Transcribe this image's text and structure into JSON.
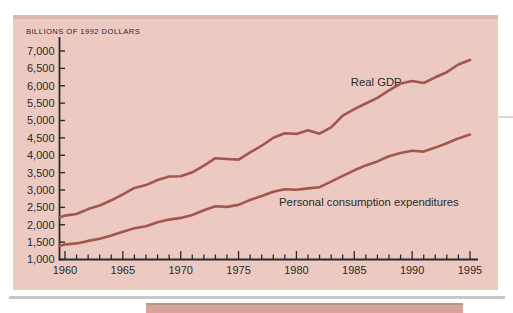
{
  "colors": {
    "page_bg": "#ffffff",
    "panel_bg": "#ecc9c1",
    "panel_top_shade": "#50403c1f",
    "line": "#a2574e",
    "axis": "#2b2b2b",
    "text": "#2b2b2b",
    "shadow_rule": "#c7c7c7",
    "caption_bar": "#d8a49a",
    "caption_bar_edge": "#b5968e",
    "artifact_line": "#dadada"
  },
  "chart_data": {
    "type": "line",
    "title": "",
    "ylabel": "BILLIONS OF 1992 DOLLARS",
    "xlabel": "",
    "xlim": [
      1959,
      1995
    ],
    "ylim": [
      1000,
      7000
    ],
    "grid": false,
    "legend_position": "inline-labels",
    "y_ticks": [
      1000,
      1500,
      2000,
      2500,
      3000,
      3500,
      4000,
      4500,
      5000,
      5500,
      6000,
      6500,
      7000
    ],
    "y_tick_labels": [
      "1,000",
      "1,500",
      "2,000",
      "2,500",
      "3,000",
      "3,500",
      "4,000",
      "4,500",
      "5,000",
      "5,500",
      "6,000",
      "6,500",
      "7,000"
    ],
    "x_tick_labels": [
      "1960",
      "1965",
      "1970",
      "1975",
      "1980",
      "1985",
      "1990",
      "1995"
    ],
    "x_minor_tick_every_years": 1,
    "years": [
      1959,
      1960,
      1961,
      1962,
      1963,
      1964,
      1965,
      1966,
      1967,
      1968,
      1969,
      1970,
      1971,
      1972,
      1973,
      1974,
      1975,
      1976,
      1977,
      1978,
      1979,
      1980,
      1981,
      1982,
      1983,
      1984,
      1985,
      1986,
      1987,
      1988,
      1989,
      1990,
      1991,
      1992,
      1993,
      1994,
      1995
    ],
    "series": [
      {
        "name": "Real GDP",
        "values": [
          2212,
          2262,
          2310,
          2449,
          2554,
          2703,
          2875,
          3060,
          3140,
          3289,
          3388,
          3398,
          3510,
          3702,
          3916,
          3891,
          3874,
          4083,
          4274,
          4503,
          4631,
          4615,
          4721,
          4620,
          4804,
          5140,
          5324,
          5488,
          5650,
          5865,
          6062,
          6136,
          6079,
          6244,
          6390,
          6611,
          6742
        ]
      },
      {
        "name": "Personal consumption expenditures",
        "values": [
          1395,
          1433,
          1462,
          1534,
          1597,
          1692,
          1799,
          1902,
          1959,
          2070,
          2148,
          2198,
          2280,
          2416,
          2533,
          2515,
          2570,
          2714,
          2830,
          2952,
          3020,
          3010,
          3046,
          3082,
          3241,
          3408,
          3567,
          3709,
          3822,
          3973,
          4065,
          4132,
          4106,
          4220,
          4344,
          4486,
          4595
        ]
      }
    ],
    "series_labels": [
      {
        "text": "Real GDP",
        "year": 1984.7,
        "value": 5980
      },
      {
        "text": "Personal consumption expenditures",
        "year": 1978.5,
        "value": 2550
      }
    ]
  }
}
